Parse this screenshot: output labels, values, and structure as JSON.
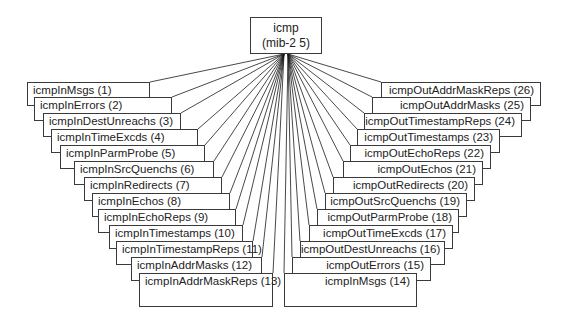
{
  "diagram": {
    "type": "tree",
    "root": {
      "name": "icmp",
      "oid": "(mib-2 5)"
    },
    "left_nodes": [
      {
        "label": "icmpInMsgs (1)"
      },
      {
        "label": "icmpInErrors  (2)"
      },
      {
        "label": "icmpInDestUnreachs (3)"
      },
      {
        "label": "icmpInTimeExcds (4)"
      },
      {
        "label": "icmpInParmProbe (5)"
      },
      {
        "label": "icmpInSrcQuenchs (6)"
      },
      {
        "label": "icmpInRedirects (7)"
      },
      {
        "label": "icmpInEchos (8)"
      },
      {
        "label": "icmpInEchoReps (9)"
      },
      {
        "label": "icmpInTimestamps (10)"
      },
      {
        "label": "icmpInTimestampReps (11)"
      },
      {
        "label": "icmpInAddrMasks (12)"
      },
      {
        "label": "icmpInAddrMaskReps (13)"
      }
    ],
    "right_nodes": [
      {
        "label": "icmpOutAddrMaskReps (26)"
      },
      {
        "label": "icmpOutAddrMasks  (25)"
      },
      {
        "label": "icmpOutTimestampReps (24)"
      },
      {
        "label": "icmpOutTimestamps (23)"
      },
      {
        "label": "icmpOutEchoReps (22)"
      },
      {
        "label": "icmpOutEchos (21)"
      },
      {
        "label": "icmpOutRedirects (20)"
      },
      {
        "label": "icmpOutSrcQuenchs (19)"
      },
      {
        "label": "icmpOutParmProbe (18)"
      },
      {
        "label": "icmpOutTimeExcds (17)"
      },
      {
        "label": "icmpOutDestUnreachs (16)"
      },
      {
        "label": "icmpOutErrors (15)"
      },
      {
        "label": "icmpInMsgs (14)"
      }
    ],
    "colors": {
      "line": "#1a1a1a",
      "border": "#3a3a3a",
      "background": "#ffffff"
    }
  }
}
